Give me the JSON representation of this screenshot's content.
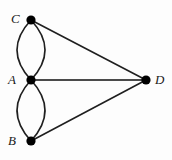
{
  "figure": {
    "name": "multigraph-diagram",
    "background_color": "#fdfdfd",
    "width": 172,
    "height": 160
  },
  "style": {
    "edge_color": "#1f1f1f",
    "edge_color_light": "#4a4a4a",
    "vertex_color": "#000000",
    "label_color": "#1a1a1a",
    "edge_width": 1.6,
    "vertex_radius": 4.6
  },
  "graph": {
    "type": "multigraph",
    "vertices": [
      {
        "id": "C",
        "label": "C",
        "x": 31,
        "y": 20,
        "label_x": 11,
        "label_y": 12
      },
      {
        "id": "A",
        "label": "A",
        "x": 31,
        "y": 80,
        "label_x": 8,
        "label_y": 73
      },
      {
        "id": "B",
        "label": "B",
        "x": 31,
        "y": 141,
        "label_x": 8,
        "label_y": 134
      },
      {
        "id": "D",
        "label": "D",
        "x": 146,
        "y": 80,
        "label_x": 155,
        "label_y": 73
      }
    ],
    "edges": [
      {
        "id": "e1",
        "from": "C",
        "to": "A",
        "shape": "curve",
        "bow": -14
      },
      {
        "id": "e2",
        "from": "C",
        "to": "A",
        "shape": "curve",
        "bow": 14
      },
      {
        "id": "e3",
        "from": "A",
        "to": "B",
        "shape": "curve",
        "bow": -14
      },
      {
        "id": "e4",
        "from": "A",
        "to": "B",
        "shape": "curve",
        "bow": 14
      },
      {
        "id": "e5",
        "from": "C",
        "to": "D",
        "shape": "line"
      },
      {
        "id": "e6",
        "from": "A",
        "to": "D",
        "shape": "line"
      },
      {
        "id": "e7",
        "from": "B",
        "to": "D",
        "shape": "line"
      }
    ]
  }
}
